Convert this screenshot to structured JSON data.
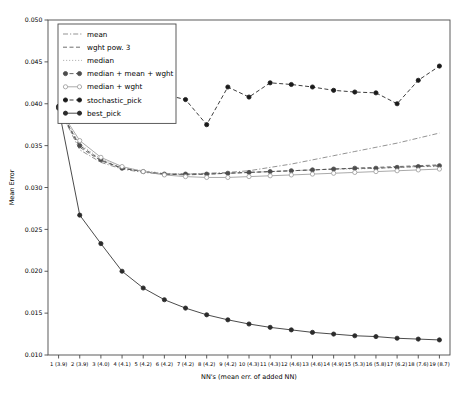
{
  "chart_data": {
    "type": "line",
    "title": "",
    "xlabel": "NN's (mean err. of added NN)",
    "ylabel": "Mean Error",
    "xlim": [
      0.5,
      19.5
    ],
    "ylim": [
      0.01,
      0.05
    ],
    "grid": false,
    "legend_position": "upper left",
    "x": [
      1,
      2,
      3,
      4,
      5,
      6,
      7,
      8,
      9,
      10,
      11,
      12,
      13,
      14,
      15,
      16,
      17,
      18,
      19
    ],
    "categories": [
      "1 (3.9)",
      "2 (3.9)",
      "3 (4.0)",
      "4 (4.1)",
      "5 (4.2)",
      "6 (4.2)",
      "7 (4.2)",
      "8 (4.2)",
      "9 (4.2)",
      "10 (4.3)",
      "11 (4.3)",
      "12 (4.6)",
      "13 (4.6)",
      "14 (4.9)",
      "15 (5.3)",
      "16 (5.8)",
      "17 (6.2)",
      "18 (7.6)",
      "19 (8.7)"
    ],
    "ytick_labels": [
      "0.010",
      "0.015",
      "0.020",
      "0.025",
      "0.030",
      "0.035",
      "0.040",
      "0.045",
      "0.050"
    ],
    "ytick_values": [
      0.01,
      0.015,
      0.02,
      0.025,
      0.03,
      0.035,
      0.04,
      0.045,
      0.05
    ],
    "series": [
      {
        "name": "mean",
        "color": "#808080",
        "linestyle": "dashdot",
        "marker": "none",
        "values": [
          0.0395,
          0.0345,
          0.033,
          0.0322,
          0.0318,
          0.0316,
          0.0316,
          0.0317,
          0.0318,
          0.032,
          0.0324,
          0.0328,
          0.0333,
          0.0338,
          0.0343,
          0.0348,
          0.0353,
          0.0359,
          0.0365
        ]
      },
      {
        "name": "wght pow. 3",
        "color": "#555555",
        "linestyle": "dashed",
        "marker": "none",
        "values": [
          0.0395,
          0.0348,
          0.0332,
          0.0323,
          0.0319,
          0.0316,
          0.0315,
          0.0316,
          0.0317,
          0.0318,
          0.0319,
          0.032,
          0.0321,
          0.0322,
          0.0323,
          0.0324,
          0.0325,
          0.0326,
          0.0327
        ]
      },
      {
        "name": "median",
        "color": "#a8a8a8",
        "linestyle": "dotted",
        "marker": "none",
        "values": [
          0.0395,
          0.0352,
          0.0334,
          0.0324,
          0.032,
          0.0317,
          0.0316,
          0.0316,
          0.0317,
          0.0318,
          0.0319,
          0.032,
          0.0321,
          0.0322,
          0.0322,
          0.0323,
          0.0324,
          0.0325,
          0.0325
        ]
      },
      {
        "name": "median + mean + wght",
        "color": "#4d4d4d",
        "linestyle": "dashed",
        "marker": "circle-filled",
        "values": [
          0.0395,
          0.035,
          0.0333,
          0.0323,
          0.0319,
          0.0316,
          0.0316,
          0.0316,
          0.0317,
          0.0318,
          0.0319,
          0.032,
          0.0321,
          0.0322,
          0.0323,
          0.0323,
          0.0324,
          0.0325,
          0.0326
        ]
      },
      {
        "name": "median + wght",
        "color": "#999999",
        "linestyle": "solid",
        "marker": "circle-open",
        "values": [
          0.0395,
          0.0356,
          0.0336,
          0.0325,
          0.0319,
          0.0315,
          0.0313,
          0.0312,
          0.0312,
          0.0313,
          0.0314,
          0.0315,
          0.0316,
          0.0317,
          0.0318,
          0.0319,
          0.032,
          0.0321,
          0.0322
        ]
      },
      {
        "name": "stochastic_pick",
        "color": "#1a1a1a",
        "linestyle": "dashed",
        "marker": "circle-filled",
        "values": [
          0.0397,
          0.0396,
          0.0396,
          0.0394,
          0.0412,
          0.0411,
          0.0405,
          0.0375,
          0.042,
          0.0408,
          0.0425,
          0.0423,
          0.042,
          0.0416,
          0.0414,
          0.0413,
          0.04,
          0.0428,
          0.0445
        ]
      },
      {
        "name": "best_pick",
        "color": "#2b2b2b",
        "linestyle": "solid",
        "marker": "circle-filled",
        "values": [
          0.0395,
          0.0267,
          0.0233,
          0.02,
          0.018,
          0.0166,
          0.0156,
          0.0148,
          0.0142,
          0.0137,
          0.0133,
          0.013,
          0.0127,
          0.0125,
          0.0123,
          0.0122,
          0.012,
          0.0119,
          0.0118
        ]
      }
    ]
  }
}
